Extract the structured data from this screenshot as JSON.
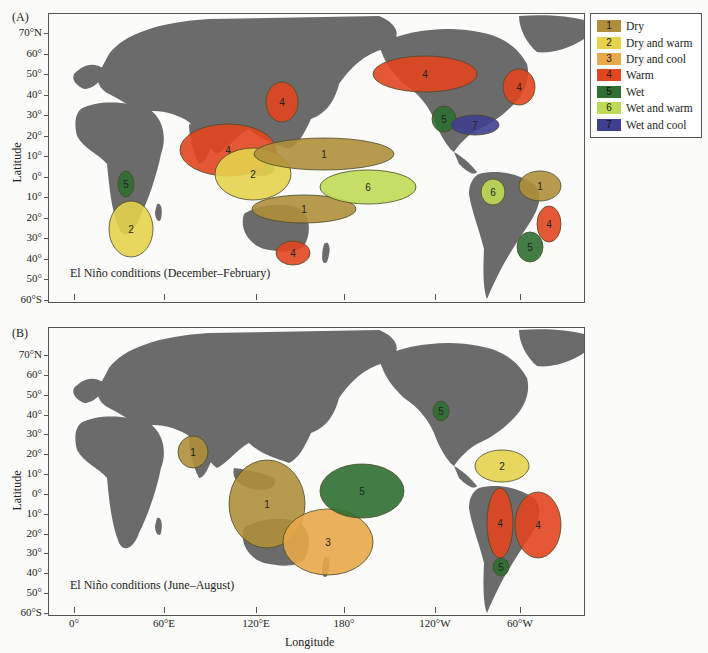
{
  "panels": [
    {
      "label": "(A)",
      "caption": "El Niño conditions (December–February)",
      "regions": [
        {
          "code": "5",
          "cx": 125,
          "cy": 183,
          "rx": 8,
          "ry": 13
        },
        {
          "code": "2",
          "cx": 130,
          "cy": 228,
          "rx": 22,
          "ry": 28
        },
        {
          "code": "4",
          "cx": 281,
          "cy": 101,
          "rx": 16,
          "ry": 20
        },
        {
          "code": "4",
          "cx": 227,
          "cy": 149,
          "rx": 48,
          "ry": 26
        },
        {
          "code": "2",
          "cx": 252,
          "cy": 173,
          "rx": 38,
          "ry": 26
        },
        {
          "code": "1",
          "cx": 323,
          "cy": 153,
          "rx": 70,
          "ry": 16
        },
        {
          "code": "1",
          "cx": 303,
          "cy": 208,
          "rx": 52,
          "ry": 14
        },
        {
          "code": "6",
          "cx": 367,
          "cy": 186,
          "rx": 48,
          "ry": 17
        },
        {
          "code": "4",
          "cx": 292,
          "cy": 252,
          "rx": 17,
          "ry": 12
        },
        {
          "code": "4",
          "cx": 424,
          "cy": 73,
          "rx": 52,
          "ry": 18
        },
        {
          "code": "4",
          "cx": 518,
          "cy": 86,
          "rx": 16,
          "ry": 18
        },
        {
          "code": "5",
          "cx": 443,
          "cy": 118,
          "rx": 12,
          "ry": 13
        },
        {
          "code": "7",
          "cx": 474,
          "cy": 124,
          "rx": 24,
          "ry": 10
        },
        {
          "code": "6",
          "cx": 492,
          "cy": 191,
          "rx": 12,
          "ry": 13
        },
        {
          "code": "1",
          "cx": 539,
          "cy": 185,
          "rx": 21,
          "ry": 15
        },
        {
          "code": "4",
          "cx": 548,
          "cy": 223,
          "rx": 12,
          "ry": 18
        },
        {
          "code": "5",
          "cx": 529,
          "cy": 246,
          "rx": 13,
          "ry": 15
        }
      ]
    },
    {
      "label": "(B)",
      "caption": "El Niño conditions (June–August)",
      "regions": [
        {
          "code": "1",
          "cx": 192,
          "cy": 451,
          "rx": 15,
          "ry": 16
        },
        {
          "code": "1",
          "cx": 266,
          "cy": 503,
          "rx": 38,
          "ry": 44
        },
        {
          "code": "3",
          "cx": 327,
          "cy": 541,
          "rx": 45,
          "ry": 33
        },
        {
          "code": "5",
          "cx": 361,
          "cy": 490,
          "rx": 42,
          "ry": 27
        },
        {
          "code": "5",
          "cx": 440,
          "cy": 410,
          "rx": 8,
          "ry": 10
        },
        {
          "code": "2",
          "cx": 501,
          "cy": 465,
          "rx": 27,
          "ry": 16
        },
        {
          "code": "4",
          "cx": 499,
          "cy": 522,
          "rx": 13,
          "ry": 35
        },
        {
          "code": "4",
          "cx": 537,
          "cy": 524,
          "rx": 23,
          "ry": 33
        },
        {
          "code": "5",
          "cx": 500,
          "cy": 566,
          "rx": 8,
          "ry": 9
        }
      ]
    }
  ],
  "legend": {
    "items": [
      {
        "code": "1",
        "label": "Dry",
        "color": "#b08f3c"
      },
      {
        "code": "2",
        "label": "Dry and warm",
        "color": "#e6d34c"
      },
      {
        "code": "3",
        "label": "Dry and cool",
        "color": "#e8a94a"
      },
      {
        "code": "4",
        "label": "Warm",
        "color": "#e2461f"
      },
      {
        "code": "5",
        "label": "Wet",
        "color": "#2f6f32"
      },
      {
        "code": "6",
        "label": "Wet and warm",
        "color": "#bfdb55"
      },
      {
        "code": "7",
        "label": "Wet and cool",
        "color": "#3e3f8e"
      }
    ]
  },
  "axes": {
    "y_title": "Latitude",
    "x_title": "Longitude",
    "lat_ticks": [
      "70°N",
      "60°",
      "50°",
      "40°",
      "30°",
      "20°",
      "10°",
      "0°",
      "10°",
      "20°",
      "30°",
      "40°",
      "50°",
      "60°S"
    ],
    "lon_ticks": [
      "0°",
      "60°E",
      "120°E",
      "180°",
      "120°W",
      "60°W"
    ]
  },
  "colors": {
    "land": "#6b6b6b",
    "ocean": "#fbfbf9",
    "frame": "#555555"
  }
}
